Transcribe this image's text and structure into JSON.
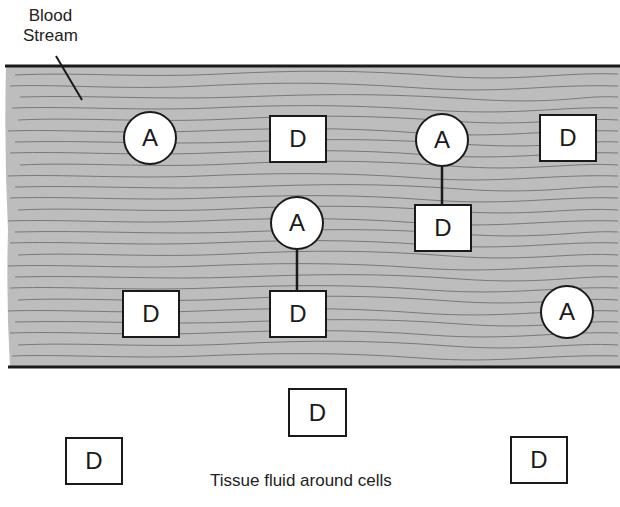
{
  "labels": {
    "blood_stream_line1": "Blood",
    "blood_stream_line2": "Stream",
    "tissue_fluid": "Tissue fluid around cells"
  },
  "colors": {
    "stream_fill": "#bdbdbd",
    "stream_streaks": "#6e6e6e",
    "border": "#1a1a1a",
    "node_fill": "#ffffff"
  },
  "nodes": {
    "a1": "A",
    "a2": "A",
    "a3": "A",
    "a4": "A",
    "a5": "A",
    "d1": "D",
    "d2": "D",
    "d3": "D",
    "d4": "D",
    "d5": "D",
    "d6": "D",
    "d7": "D",
    "d8": "D"
  }
}
